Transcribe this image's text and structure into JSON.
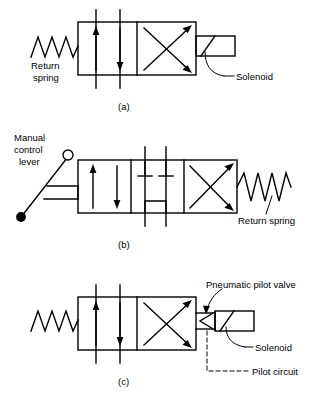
{
  "figure": {
    "title_implicit": "Directional control valve symbols",
    "stroke_color": "#000000",
    "background_color": "#ffffff"
  },
  "diagrams": [
    {
      "caption": "(a)",
      "kind": "two-position-four-way-solenoid-spring-valve",
      "positions": 2,
      "labels": [
        {
          "name": "return-spring-label",
          "text_line_1": "Return",
          "text_line_2": "spring"
        },
        {
          "name": "solenoid-label",
          "text": "Solenoid"
        }
      ],
      "actuators": [
        "return-spring",
        "solenoid"
      ],
      "port_lines": 2,
      "flow_arrows": [
        "up",
        "down",
        "cross-up",
        "cross-down"
      ]
    },
    {
      "caption": "(b)",
      "kind": "three-position-manual-lever-spring-valve",
      "positions": 3,
      "labels": [
        {
          "name": "manual-control-lever-label",
          "text_line_1": "Manual",
          "text_line_2": "control",
          "text_line_3": "lever"
        },
        {
          "name": "return-spring-label",
          "text": "Return spring"
        }
      ],
      "actuators": [
        "manual-control-lever",
        "return-spring"
      ],
      "center_position": "all-ports-blocked",
      "port_lines": 2,
      "flow_arrows": [
        "up",
        "down",
        "cross-up",
        "cross-down"
      ]
    },
    {
      "caption": "(c)",
      "kind": "solenoid-pilot-operated-spring-return-valve",
      "positions": 2,
      "labels": [
        {
          "name": "pneumatic-pilot-valve-label",
          "text": "Pneumatic pilot valve"
        },
        {
          "name": "solenoid-label",
          "text": "Solenoid"
        },
        {
          "name": "pilot-circuit-label",
          "text": "Pilot circuit"
        }
      ],
      "actuators": [
        "return-spring",
        "pneumatic-pilot-valve",
        "solenoid"
      ],
      "pilot_circuit_style": "dashed",
      "port_lines": 2,
      "flow_arrows": [
        "up",
        "down",
        "cross-up",
        "cross-down"
      ]
    }
  ],
  "captions": {
    "a": "(a)",
    "b": "(b)",
    "c": "(c)"
  },
  "text": {
    "return_1": "Return",
    "spring_1": "spring",
    "solenoid_a": "Solenoid",
    "manual_1": "Manual",
    "manual_2": "control",
    "manual_3": "lever",
    "return_spring_b": "Return spring",
    "pneumatic_pilot_valve": "Pneumatic pilot valve",
    "solenoid_c": "Solenoid",
    "pilot_circuit": "Pilot circuit"
  }
}
